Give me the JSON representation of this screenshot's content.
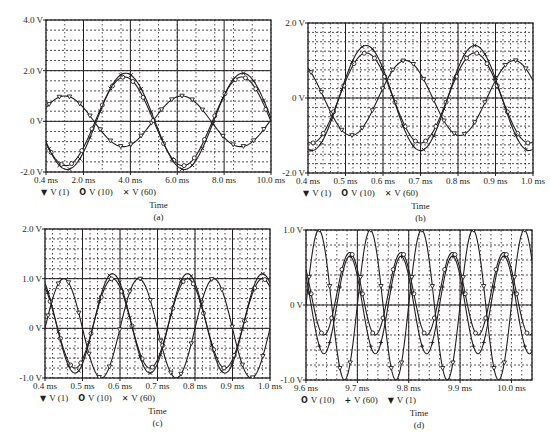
{
  "chart_data": [
    {
      "id": "a",
      "type": "line",
      "caption": "(a)",
      "xlabel": "Time",
      "ylabel": "",
      "xlim": [
        0.4,
        10.0
      ],
      "ylim": [
        -2.0,
        4.0
      ],
      "x_unit": "ms",
      "x_ticks": [
        {
          "v": 0.4,
          "label": "0.4 ms"
        },
        {
          "v": 2.0,
          "label": "2.0 ms"
        },
        {
          "v": 4.0,
          "label": "4.0 ms"
        },
        {
          "v": 6.0,
          "label": "6.0 ms"
        },
        {
          "v": 8.0,
          "label": "8.0 ms"
        },
        {
          "v": 10.0,
          "label": "10.0 ms"
        }
      ],
      "y_ticks": [
        {
          "v": -2.0,
          "label": "-2.0 V"
        },
        {
          "v": 0,
          "label": "0 V"
        },
        {
          "v": 2.0,
          "label": "2.0 V"
        },
        {
          "v": 4.0,
          "label": "4.0 V"
        }
      ],
      "major_x": [
        2,
        4,
        6,
        8
      ],
      "minor_x_step": 0.8,
      "minor_y_step": 0.4,
      "major_y": [
        0,
        2.0
      ],
      "grid": true,
      "legend": [
        {
          "marker": "▼",
          "name": "V (1)"
        },
        {
          "marker": "O",
          "name": "V (10)"
        },
        {
          "marker": "✕",
          "name": "V (60)"
        }
      ],
      "series": [
        {
          "name": "V (1)",
          "amplitude": 1.0,
          "offset": 0.0,
          "freq_khz": 0.2,
          "peak_at_ms": 1.2,
          "marker": "triangle"
        },
        {
          "name": "V (10)",
          "amplitude": 1.75,
          "offset": 0.0,
          "freq_khz": 0.2,
          "peak_at_ms": 3.75,
          "marker": "circle"
        },
        {
          "name": "V (60)",
          "amplitude": 1.9,
          "offset": 0.0,
          "freq_khz": 0.2,
          "peak_at_ms": 3.8,
          "marker": "x"
        }
      ]
    },
    {
      "id": "b",
      "type": "line",
      "caption": "(b)",
      "xlabel": "Time",
      "ylabel": "",
      "xlim": [
        0.4,
        1.0
      ],
      "ylim": [
        -2.0,
        2.0
      ],
      "x_unit": "ms",
      "x_ticks": [
        {
          "v": 0.4,
          "label": "0.4 ms"
        },
        {
          "v": 0.5,
          "label": "0.5 ms"
        },
        {
          "v": 0.6,
          "label": "0.6 ms"
        },
        {
          "v": 0.7,
          "label": "0.7 ms"
        },
        {
          "v": 0.8,
          "label": "0.8 ms"
        },
        {
          "v": 0.9,
          "label": "0.9 ms"
        },
        {
          "v": 1.0,
          "label": "1.0 ms"
        }
      ],
      "y_ticks": [
        {
          "v": -2.0,
          "label": "-2.0 V"
        },
        {
          "v": 0,
          "label": "0 V"
        },
        {
          "v": 2.0,
          "label": "2.0 V"
        }
      ],
      "major_x": [
        0.5,
        0.6,
        0.7,
        0.8,
        0.9
      ],
      "minor_x_step": 0.02,
      "minor_y_step": 0.25,
      "major_y": [
        0
      ],
      "grid": true,
      "legend": [
        {
          "marker": "▼",
          "name": "V (1)"
        },
        {
          "marker": "O",
          "name": "V (10)"
        },
        {
          "marker": "✕",
          "name": "V (60)"
        }
      ],
      "series": [
        {
          "name": "V (1)",
          "amplitude": 1.0,
          "offset": 0.0,
          "freq_khz": 3.45,
          "peak_at_ms": 0.66,
          "marker": "triangle"
        },
        {
          "name": "V (10)",
          "amplitude": 1.2,
          "offset": 0.0,
          "freq_khz": 3.45,
          "peak_at_ms": 0.555,
          "marker": "circle"
        },
        {
          "name": "V (60)",
          "amplitude": 1.4,
          "offset": 0.0,
          "freq_khz": 3.45,
          "peak_at_ms": 0.555,
          "marker": "x"
        }
      ]
    },
    {
      "id": "c",
      "type": "line",
      "caption": "(c)",
      "xlabel": "Time",
      "ylabel": "",
      "xlim": [
        0.4,
        1.0
      ],
      "ylim": [
        -1.0,
        2.0
      ],
      "x_unit": "ms",
      "x_ticks": [
        {
          "v": 0.4,
          "label": "0.4 ms"
        },
        {
          "v": 0.5,
          "label": "0.5 ms"
        },
        {
          "v": 0.6,
          "label": "0.6 ms"
        },
        {
          "v": 0.7,
          "label": "0.7 ms"
        },
        {
          "v": 0.8,
          "label": "0.8 ms"
        },
        {
          "v": 0.9,
          "label": "0.9 ms"
        },
        {
          "v": 1.0,
          "label": "1.0 ms"
        }
      ],
      "y_ticks": [
        {
          "v": -1.0,
          "label": "-1.0 V"
        },
        {
          "v": 0,
          "label": "0 V"
        },
        {
          "v": 1.0,
          "label": "1.0 V"
        },
        {
          "v": 2.0,
          "label": "2.0 V"
        }
      ],
      "major_x": [
        0.5,
        0.6,
        0.7,
        0.8,
        0.9
      ],
      "minor_x_step": 0.02,
      "minor_y_step": 0.2,
      "major_y": [
        0,
        1.0
      ],
      "grid": true,
      "legend": [
        {
          "marker": "▼",
          "name": "V (1)"
        },
        {
          "marker": "O",
          "name": "V (10)"
        },
        {
          "marker": "✕",
          "name": "V (60)"
        }
      ],
      "series": [
        {
          "name": "V (1)",
          "amplitude": 1.0,
          "offset": 0.0,
          "freq_khz": 5.0,
          "peak_at_ms": 0.45,
          "marker": "triangle"
        },
        {
          "name": "V (10)",
          "amplitude": 0.9,
          "offset": 0.1,
          "freq_khz": 5.0,
          "peak_at_ms": 0.58,
          "marker": "circle"
        },
        {
          "name": "V (60)",
          "amplitude": 1.0,
          "offset": 0.1,
          "freq_khz": 5.0,
          "peak_at_ms": 0.58,
          "marker": "x"
        }
      ]
    },
    {
      "id": "d",
      "type": "line",
      "caption": "(d)",
      "xlabel": "Time",
      "ylabel": "",
      "xlim": [
        9.6,
        10.04
      ],
      "ylim": [
        -1.0,
        1.0
      ],
      "x_unit": "ms",
      "x_ticks": [
        {
          "v": 9.6,
          "label": "9.6 ms"
        },
        {
          "v": 9.7,
          "label": "9.7 ms"
        },
        {
          "v": 9.8,
          "label": "9.8 ms"
        },
        {
          "v": 9.9,
          "label": "9.9 ms"
        },
        {
          "v": 10.0,
          "label": "10.0 ms"
        }
      ],
      "y_ticks": [
        {
          "v": -1.0,
          "label": "-1.0 V"
        },
        {
          "v": 0,
          "label": "0 V"
        },
        {
          "v": 1.0,
          "label": "1.0 V"
        }
      ],
      "major_x": [
        9.7,
        9.8,
        9.9
      ],
      "minor_x_step": 0.02,
      "minor_y_step": 0.2,
      "major_y": [
        0
      ],
      "grid": true,
      "legend": [
        {
          "marker": "O",
          "name": "V (10)"
        },
        {
          "marker": "+",
          "name": "V (60)"
        },
        {
          "marker": "▼",
          "name": "V (1)"
        }
      ],
      "series": [
        {
          "name": "V (10)",
          "amplitude": 0.55,
          "offset": 0.15,
          "freq_khz": 10.0,
          "peak_at_ms": 9.685,
          "marker": "circle"
        },
        {
          "name": "V (60)",
          "amplitude": 0.65,
          "offset": 0.0,
          "freq_khz": 10.0,
          "peak_at_ms": 9.685,
          "marker": "plus"
        },
        {
          "name": "V (1)",
          "amplitude": 1.0,
          "offset": 0.0,
          "freq_khz": 10.0,
          "peak_at_ms": 9.625,
          "marker": "triangle"
        }
      ]
    }
  ],
  "panels": {
    "a": {
      "left": 46,
      "top": 20,
      "width": 225,
      "height": 152
    },
    "b": {
      "left": 308,
      "top": 23,
      "width": 225,
      "height": 150
    },
    "c": {
      "left": 45,
      "top": 229,
      "width": 225,
      "height": 149
    },
    "d": {
      "left": 306,
      "top": 230,
      "width": 226,
      "height": 150
    }
  },
  "colors": {
    "line": "#231f20",
    "grid": "#231f20",
    "background": "#ffffff"
  }
}
